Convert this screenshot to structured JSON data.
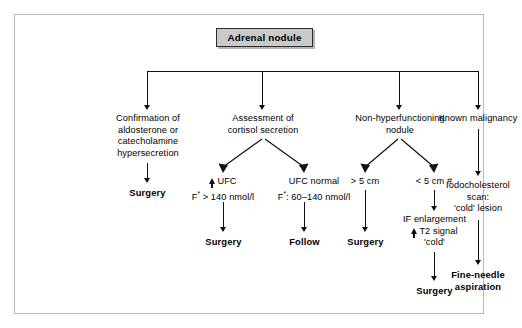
{
  "diagram": {
    "title": "Adrenal nodule",
    "root": {
      "label": "Adrenal nodule"
    },
    "branches": [
      {
        "id": "branch-1",
        "label": "Confirmation of aldosterone or catecholamine hypersecretion",
        "line1": "Confirmation of",
        "line2": "aldosterone or",
        "line3": "catecholamine",
        "line4": "hypersecretion",
        "outcome": "Surgery"
      },
      {
        "id": "branch-2",
        "label": "Assessment of cortisol secretion",
        "line1": "Assessment of",
        "line2": "cortisol secretion",
        "children": [
          {
            "id": "branch-2a",
            "marker": "up-arrow",
            "line1": "UFC",
            "line2_prefix": "F",
            "line2_sup": "*",
            "line2_rest": " > 140 nmol/l",
            "line2": "F* > 140 nmol/l",
            "outcome": "Surgery"
          },
          {
            "id": "branch-2b",
            "line1": "UFC normal",
            "line2_prefix": "F",
            "line2_sup": "*",
            "line2_rest": ": 60–140 nmol/l",
            "line2": "F*: 60–140 nmol/l",
            "outcome": "Follow"
          }
        ]
      },
      {
        "id": "branch-3",
        "label": "Non-hyperfunctioning nodule",
        "line1": "Non-hyperfunctioning",
        "line2": "nodule",
        "children": [
          {
            "id": "branch-3a",
            "line1": "> 5 cm",
            "outcome": "Surgery"
          },
          {
            "id": "branch-3b",
            "line1": "< 5 cm #",
            "detail_line1": "IF enlargement",
            "detail_marker": "up-arrow",
            "detail_line2": "T2 signal",
            "detail_line3": "'cold'",
            "outcome": "Surgery"
          }
        ]
      },
      {
        "id": "branch-4",
        "label": "Known malignancy",
        "line1": "Known malignancy",
        "step_line1": "Iodocholesterol",
        "step_line2": "scan:",
        "step_line3": "'cold' lesion",
        "outcome_line1": "Fine-needle",
        "outcome_line2": "aspiration"
      }
    ]
  },
  "colors": {
    "title_box_fill": "#c9c9c9",
    "title_box_border": "#2b2b2b",
    "connector": "#111111",
    "panel_border": "#b9b9b9",
    "background": "#ffffff",
    "text": "#000000"
  }
}
